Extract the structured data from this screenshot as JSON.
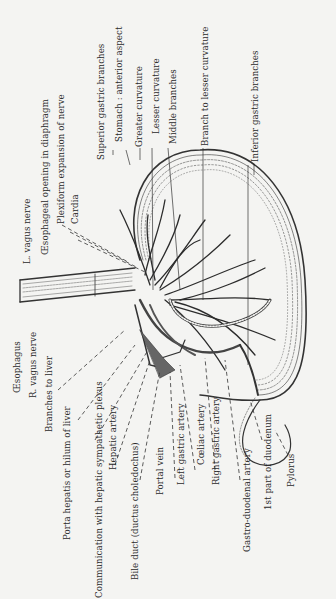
{
  "diagram": {
    "orientation": "rotated 90° counter-clockwise (labels read bottom-to-top)",
    "labels": {
      "oesophagus": "Œsophagus",
      "r_vagus": "R. vagus nerve",
      "l_vagus": "L. vagus nerve",
      "branches_liver": "Branches to liver",
      "porta_hepatis": "Porta hepatis or hilum of liver",
      "communication": "Communication with hepatic sympathetic plexus",
      "hepatic_artery": "Hepatic artery",
      "bile_duct": "Bile duct (ductus choledochus)",
      "portal_vein": "Portal vein",
      "left_gastric": "Left gastric artery",
      "coeliac": "Cœliac artery",
      "right_gastric": "Right gastric artery",
      "gastro_duodenal": "Gastro-duodenal artery",
      "duodenum": "1st part of duodenum",
      "pylorus": "Pylorus",
      "oesophageal_opening": "Œsophageal opening in diaphragm",
      "plexiform": "Plexiform expansion of nerve",
      "cardia": "Cardia",
      "superior_gastric": "Superior gastric branches",
      "stomach": "Stomach : anterior aspect",
      "greater_curvature": "Greater curvature",
      "lesser_curvature": "Lesser curvature",
      "middle_branches": "Middle branches",
      "branch_lesser": "Branch to lesser curvature",
      "inferior_gastric": "Inferior gastric branches"
    }
  }
}
